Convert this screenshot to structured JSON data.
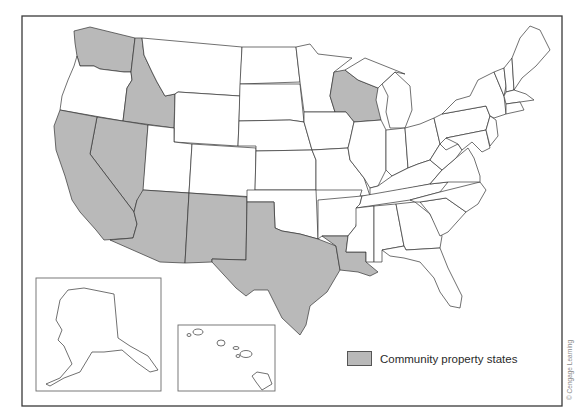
{
  "map": {
    "title": "",
    "type": "choropleth",
    "region": "United States",
    "fill_colors": {
      "community_property": "#b9b9b9",
      "other": "#ffffff",
      "border": "#333333"
    },
    "highlighted_states": [
      "Washington",
      "Idaho",
      "Nevada",
      "California",
      "Arizona",
      "New Mexico",
      "Texas",
      "Louisiana",
      "Wisconsin"
    ],
    "insets": [
      {
        "name": "Alaska",
        "highlighted": false
      },
      {
        "name": "Hawaii",
        "highlighted": false
      }
    ]
  },
  "legend": {
    "items": [
      {
        "label": "Community property states",
        "color": "#b9b9b9"
      }
    ]
  },
  "credit": "© Cengage Learning"
}
